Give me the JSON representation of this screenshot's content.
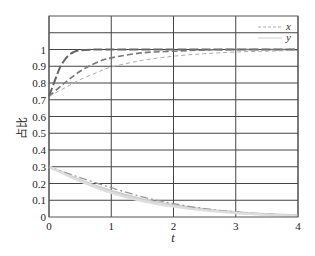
{
  "chart_data": {
    "type": "line",
    "title": "",
    "xlabel": "t",
    "ylabel": "占比",
    "xlim": [
      0,
      4
    ],
    "ylim": [
      0,
      1.2
    ],
    "xticks": [
      "0",
      "1",
      "2",
      "3",
      "4"
    ],
    "yticks": [
      "0",
      "0.1",
      "0.2",
      "0.3",
      "0.4",
      "0.5",
      "0.6",
      "0.7",
      "0.8",
      "0.9",
      "1"
    ],
    "grid": true,
    "legend": {
      "position": "upper right",
      "entries": [
        "x",
        "y"
      ]
    },
    "series": [
      {
        "name": "x (fast)",
        "group": "x",
        "style": "long-dash",
        "color": "#666666",
        "x": [
          0,
          0.05,
          0.1,
          0.15,
          0.2,
          0.3,
          0.4,
          0.5,
          0.75,
          1,
          2,
          3,
          4
        ],
        "y": [
          0.72,
          0.77,
          0.82,
          0.87,
          0.91,
          0.96,
          0.985,
          0.995,
          1.0,
          1.0,
          1.0,
          1.0,
          1.0
        ]
      },
      {
        "name": "x (medium)",
        "group": "x",
        "style": "dash",
        "color": "#777777",
        "x": [
          0,
          0.25,
          0.5,
          0.75,
          1,
          1.5,
          2,
          2.5,
          3,
          4
        ],
        "y": [
          0.72,
          0.8,
          0.87,
          0.92,
          0.95,
          0.98,
          0.99,
          0.997,
          1.0,
          1.0
        ]
      },
      {
        "name": "x (slow)",
        "group": "x",
        "style": "short-dash",
        "color": "#aaaaaa",
        "x": [
          0,
          0.25,
          0.5,
          0.75,
          1,
          1.5,
          2,
          2.5,
          3,
          3.5,
          4
        ],
        "y": [
          0.72,
          0.77,
          0.82,
          0.86,
          0.895,
          0.935,
          0.96,
          0.975,
          0.985,
          0.99,
          0.995
        ]
      },
      {
        "name": "y (1)",
        "group": "y",
        "style": "solid",
        "color": "#cccccc",
        "x": [
          0,
          0.5,
          1,
          1.5,
          2,
          2.5,
          3,
          3.5,
          4
        ],
        "y": [
          0.3,
          0.22,
          0.155,
          0.105,
          0.07,
          0.045,
          0.028,
          0.016,
          0.01
        ]
      },
      {
        "name": "y (2)",
        "group": "y",
        "style": "dash-dot",
        "color": "#999999",
        "x": [
          0,
          0.5,
          1,
          1.5,
          2,
          2.5,
          3,
          3.5,
          4
        ],
        "y": [
          0.3,
          0.235,
          0.175,
          0.12,
          0.08,
          0.05,
          0.03,
          0.018,
          0.01
        ]
      },
      {
        "name": "y (3)",
        "group": "y",
        "style": "solid",
        "color": "#dddddd",
        "x": [
          0,
          0.5,
          1,
          1.5,
          2,
          2.5,
          3,
          3.5,
          4
        ],
        "y": [
          0.3,
          0.215,
          0.145,
          0.095,
          0.062,
          0.04,
          0.024,
          0.014,
          0.008
        ]
      }
    ]
  },
  "legend": {
    "x_label": "x",
    "y_label": "y"
  },
  "axes": {
    "xlabel": "t",
    "ylabel": "占比"
  }
}
